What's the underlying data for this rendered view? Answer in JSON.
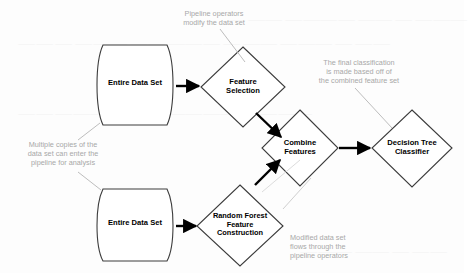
{
  "diagram": {
    "colors": {
      "shape_stroke": "#3c3c3c",
      "shape_fill": "#ffffff",
      "arrow": "#000000",
      "annotation_text": "#a8a8a8",
      "leader_line": "#bdbdbd",
      "label_text": "#000000",
      "background": "#fdfdfd"
    },
    "nodes": [
      {
        "id": "entire-data-set-top",
        "type": "cylinder",
        "label": "Entire Data Set"
      },
      {
        "id": "feature-selection",
        "type": "diamond",
        "label": "Feature\nSelection"
      },
      {
        "id": "combine-features",
        "type": "diamond",
        "label": "Combine\nFeatures"
      },
      {
        "id": "decision-tree-classifier",
        "type": "diamond",
        "label": "Decision Tree\nClassifier"
      },
      {
        "id": "entire-data-set-bottom",
        "type": "cylinder",
        "label": "Entire Data Set"
      },
      {
        "id": "random-forest-feature-construction",
        "type": "diamond",
        "label": "Random Forest\nFeature\nConstruction"
      }
    ],
    "annotations": [
      {
        "id": "pipeline-operators-note",
        "text": "Pipeline operators\nmodify the data set"
      },
      {
        "id": "final-classification-note",
        "text": "The final classification\nis made based off of\nthe combined feature set"
      },
      {
        "id": "multiple-copies-note",
        "text": "Multiple copies of the\ndata set can enter the\npipeline for analysis"
      },
      {
        "id": "modified-data-set-note",
        "text": "Modified data set\nflows through the\npipeline operators"
      }
    ],
    "edges": [
      {
        "id": "edge-top-data-to-feature-selection",
        "from": "entire-data-set-top",
        "to": "feature-selection"
      },
      {
        "id": "edge-feature-selection-to-combine",
        "from": "feature-selection",
        "to": "combine-features"
      },
      {
        "id": "edge-combine-to-decision-tree",
        "from": "combine-features",
        "to": "decision-tree-classifier"
      },
      {
        "id": "edge-bottom-data-to-random-forest",
        "from": "entire-data-set-bottom",
        "to": "random-forest-feature-construction"
      },
      {
        "id": "edge-random-forest-to-combine",
        "from": "random-forest-feature-construction",
        "to": "combine-features"
      }
    ]
  }
}
